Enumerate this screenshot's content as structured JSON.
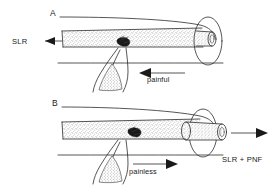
{
  "figure": {
    "background_color": "#ffffff",
    "ink_color": "#2b2b2b",
    "lesion_color": "#1a1a1a"
  },
  "panels": [
    {
      "letter": "A",
      "letter_x": 50,
      "letter_y": 16,
      "description": "Nerve with lesion at root junction, painful on tension",
      "labels": [
        {
          "name": "slr-label-a",
          "text": "SLR",
          "x": 12,
          "y": 44,
          "arrow": "left"
        },
        {
          "name": "painful-label",
          "text": "painful",
          "x": 147,
          "y": 82,
          "arrow": "left"
        }
      ]
    },
    {
      "letter": "B",
      "letter_x": 52,
      "letter_y": 106,
      "description": "Nerve gliding within sleeve, lesion displaced, painless",
      "labels": [
        {
          "name": "painless-label",
          "text": "painless",
          "x": 129,
          "y": 174,
          "arrow": "right"
        },
        {
          "name": "slr-pnf-label",
          "text": "SLR + PNF",
          "x": 222,
          "y": 162,
          "arrow": "right"
        }
      ]
    }
  ],
  "annotations": {
    "slr_a": "SLR",
    "painful": "painful",
    "painless": "painless",
    "slr_pnf": "SLR + PNF",
    "panel_a": "A",
    "panel_b": "B"
  }
}
